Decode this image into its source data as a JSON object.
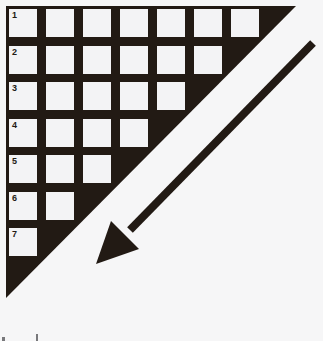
{
  "puzzle": {
    "rows": [
      {
        "number": "1",
        "cells": 7
      },
      {
        "number": "2",
        "cells": 6
      },
      {
        "number": "3",
        "cells": 5
      },
      {
        "number": "4",
        "cells": 4
      },
      {
        "number": "5",
        "cells": 3
      },
      {
        "number": "6",
        "cells": 2
      },
      {
        "number": "7",
        "cells": 1
      }
    ]
  },
  "icons": {
    "arrow": "arrow-down-left"
  },
  "colors": {
    "ink": "#221a14",
    "cell_fill": "#f3f3f5",
    "background": "#f6f6f7"
  }
}
